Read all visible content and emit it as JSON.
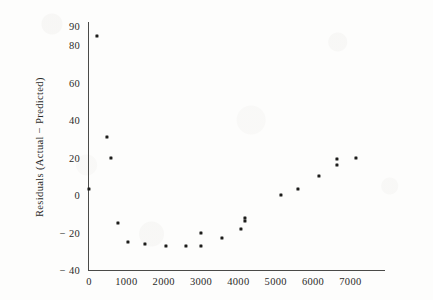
{
  "chart_data": {
    "type": "scatter",
    "title": "",
    "xlabel": "",
    "ylabel": "Residuals  (Actual  −  Predicted)",
    "xlim": [
      -150,
      7600
    ],
    "ylim": [
      -40,
      92
    ],
    "xticks": [
      0,
      1000,
      2000,
      3000,
      4000,
      5000,
      6000,
      7000
    ],
    "xtick_labels": [
      "0",
      "1000",
      "2000",
      "3000",
      "4000",
      "5000",
      "6000",
      "7000"
    ],
    "yticks": [
      -40,
      -20,
      0,
      20,
      40,
      60,
      80,
      90
    ],
    "ytick_labels": [
      "− 40",
      "− 20",
      "0",
      "20",
      "40",
      "60",
      "80",
      "90"
    ],
    "grid": false,
    "legend": null,
    "marker": "square",
    "marker_color": "#1d1d1b",
    "axis_color": "#4a4a48",
    "background_color": "#fdfdfc",
    "points": [
      {
        "x": 220,
        "y": 85
      },
      {
        "x": 480,
        "y": 31
      },
      {
        "x": 590,
        "y": 20
      },
      {
        "x": 0,
        "y": 3
      },
      {
        "x": 780,
        "y": -15
      },
      {
        "x": 1050,
        "y": -25
      },
      {
        "x": 1500,
        "y": -26
      },
      {
        "x": 2050,
        "y": -27
      },
      {
        "x": 2600,
        "y": -27
      },
      {
        "x": 3000,
        "y": -27
      },
      {
        "x": 3000,
        "y": -20
      },
      {
        "x": 3550,
        "y": -23
      },
      {
        "x": 4180,
        "y": -14
      },
      {
        "x": 4070,
        "y": -18
      },
      {
        "x": 4180,
        "y": -12
      },
      {
        "x": 5150,
        "y": 0
      },
      {
        "x": 5600,
        "y": 3
      },
      {
        "x": 6150,
        "y": 10
      },
      {
        "x": 6650,
        "y": 16
      },
      {
        "x": 6650,
        "y": 19
      },
      {
        "x": 7150,
        "y": 20
      }
    ]
  }
}
